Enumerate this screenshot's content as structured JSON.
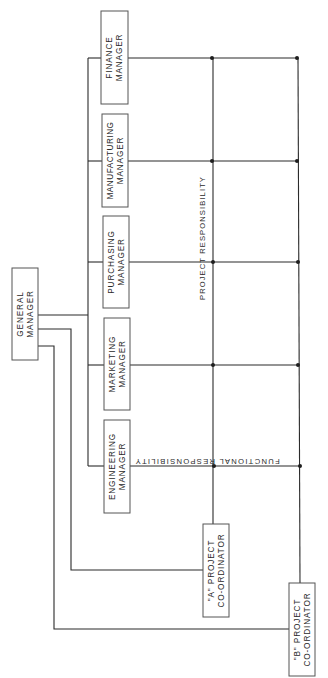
{
  "diagram": {
    "type": "matrix-organization-chart",
    "orientation": "rotated-90",
    "colors": {
      "line": "#2b2b2b",
      "box_border": "#555555",
      "text": "#2a2a2a",
      "background": "#ffffff"
    },
    "top": {
      "id": "general_manager",
      "line1": "GENERAL",
      "line2": "MANAGER"
    },
    "functional_managers": [
      {
        "id": "finance",
        "line1": "FINANCE",
        "line2": "MANAGER"
      },
      {
        "id": "manufacturing",
        "line1": "MANUFACTURING",
        "line2": "MANAGER"
      },
      {
        "id": "purchasing",
        "line1": "PURCHASING",
        "line2": "MANAGER"
      },
      {
        "id": "marketing",
        "line1": "MARKETING",
        "line2": "MANAGER"
      },
      {
        "id": "engineering",
        "line1": "ENGINEERING",
        "line2": "MANAGER"
      }
    ],
    "project_coordinators": [
      {
        "id": "a",
        "line1": "\"A\" PROJECT",
        "line2": "CO-ORDINATOR"
      },
      {
        "id": "b",
        "line1": "\"B\" PROJECT",
        "line2": "CO-ORDINATOR"
      }
    ],
    "axis_labels": {
      "project_responsibility": "PROJECT   RESPONSIBILITY",
      "functional_responsibility": "FUNCTIONAL   RESPONSIBILITY"
    }
  }
}
